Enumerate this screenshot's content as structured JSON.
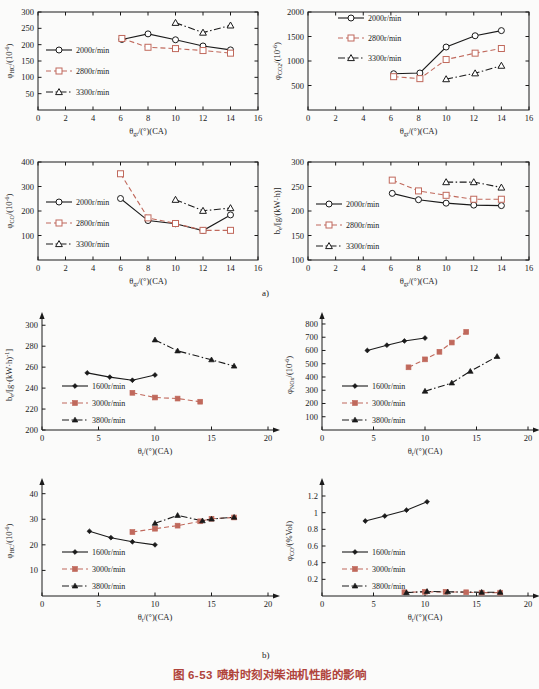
{
  "caption": {
    "part_a_label": "a)",
    "part_b_label": "b)",
    "figure_caption": "图 6-53  喷射时刻对柴油机性能的影响",
    "caption_color": "#b0443c"
  },
  "legend_labels_a": [
    "2000r/min",
    "2800r/min",
    "3300r/min"
  ],
  "legend_labels_b": [
    "1600r/min",
    "3000r/min",
    "3800r/min"
  ],
  "colors": {
    "series1": "#1a1a1a",
    "series2": "#c0695c",
    "series3": "#1a1a1a"
  },
  "chart_data": [
    {
      "id": "hc-a",
      "type": "line",
      "title": "",
      "xlabel": "θgt/(°)(CA)",
      "ylabel": "φHC/(10⁻⁶)",
      "xlim": [
        0,
        16
      ],
      "ylim": [
        0,
        300
      ],
      "xticks": [
        0,
        2,
        4,
        6,
        8,
        10,
        12,
        14,
        16
      ],
      "yticks": [
        50,
        100,
        150,
        200,
        250,
        300
      ],
      "grid": false,
      "legend_position": "left-middle",
      "series": [
        {
          "name": "2000r/min",
          "marker": "circle",
          "style": "solid",
          "color": "#1a1a1a",
          "x": [
            6.1,
            8.0,
            10.0,
            12.0,
            14.0
          ],
          "y": [
            216,
            233,
            215,
            196,
            184
          ]
        },
        {
          "name": "2800r/min",
          "marker": "square",
          "style": "dashed",
          "color": "#c0695c",
          "x": [
            6.1,
            8.0,
            10.0,
            12.0,
            14.0
          ],
          "y": [
            219,
            192,
            188,
            182,
            174
          ]
        },
        {
          "name": "3300r/min",
          "marker": "triangle",
          "style": "dashdot",
          "color": "#1a1a1a",
          "x": [
            10.0,
            12.0,
            14.0
          ],
          "y": [
            267,
            237,
            259
          ]
        }
      ]
    },
    {
      "id": "co2-a",
      "type": "line",
      "title": "",
      "xlabel": "θgt/(°)(CA)",
      "ylabel": "φCO₂/(10⁻⁶)",
      "xlim": [
        0,
        16
      ],
      "ylim": [
        0,
        2000
      ],
      "xticks": [
        0,
        2,
        4,
        6,
        8,
        10,
        12,
        14,
        16
      ],
      "yticks": [
        500,
        1000,
        1500,
        2000
      ],
      "grid": false,
      "legend_position": "top-center",
      "series": [
        {
          "name": "2000r/min",
          "marker": "circle",
          "style": "solid",
          "color": "#1a1a1a",
          "x": [
            6.2,
            8.1,
            10.0,
            12.1,
            14.0
          ],
          "y": [
            740,
            755,
            1285,
            1515,
            1620
          ]
        },
        {
          "name": "2800r/min",
          "marker": "square",
          "style": "dashed",
          "color": "#c0695c",
          "x": [
            6.2,
            8.1,
            10.0,
            12.1,
            14.0
          ],
          "y": [
            680,
            640,
            1030,
            1160,
            1255
          ]
        },
        {
          "name": "3300r/min",
          "marker": "triangle",
          "style": "dashdot",
          "color": "#1a1a1a",
          "x": [
            10.0,
            12.1,
            14.0
          ],
          "y": [
            630,
            750,
            905
          ]
        }
      ]
    },
    {
      "id": "co-a",
      "type": "line",
      "title": "",
      "xlabel": "θgt/(°)(CA)",
      "ylabel": "φCO/(10⁻⁶)",
      "xlim": [
        0,
        16
      ],
      "ylim": [
        0,
        400
      ],
      "xticks": [
        0,
        2,
        4,
        6,
        8,
        10,
        12,
        14,
        16
      ],
      "yticks": [
        100,
        200,
        300,
        400
      ],
      "grid": false,
      "legend_position": "left-middle",
      "series": [
        {
          "name": "2000r/min",
          "marker": "circle",
          "style": "solid",
          "color": "#1a1a1a",
          "x": [
            6.0,
            8.0,
            10.0,
            12.0,
            14.0
          ],
          "y": [
            251,
            161,
            148,
            120,
            184
          ]
        },
        {
          "name": "2800r/min",
          "marker": "square",
          "style": "dashed",
          "color": "#c0695c",
          "x": [
            6.0,
            8.0,
            10.0,
            12.0,
            14.0
          ],
          "y": [
            352,
            172,
            149,
            121,
            121
          ]
        },
        {
          "name": "3300r/min",
          "marker": "triangle",
          "style": "dashdot",
          "color": "#1a1a1a",
          "x": [
            10.0,
            12.0,
            14.0
          ],
          "y": [
            246,
            201,
            212
          ]
        }
      ]
    },
    {
      "id": "be-a",
      "type": "line",
      "title": "",
      "xlabel": "θgt/(°)(CA)",
      "ylabel": "be/[g/(kW·h)]",
      "xlim": [
        0,
        16
      ],
      "ylim": [
        100,
        300
      ],
      "xticks": [
        0,
        2,
        4,
        6,
        8,
        10,
        12,
        14,
        16
      ],
      "yticks": [
        100,
        150,
        200,
        250,
        300
      ],
      "grid": false,
      "legend_position": "left-middle",
      "series": [
        {
          "name": "2000r/min",
          "marker": "circle",
          "style": "solid",
          "color": "#1a1a1a",
          "x": [
            6.1,
            8.0,
            10.0,
            12.0,
            14.0
          ],
          "y": [
            236,
            223,
            216,
            212,
            211
          ]
        },
        {
          "name": "2800r/min",
          "marker": "square",
          "style": "dashed",
          "color": "#c0695c",
          "x": [
            6.1,
            8.0,
            10.0,
            12.0,
            14.0
          ],
          "y": [
            263,
            241,
            232,
            224,
            224
          ]
        },
        {
          "name": "3300r/min",
          "marker": "triangle",
          "style": "dashdot",
          "color": "#1a1a1a",
          "x": [
            10.0,
            12.0,
            14.0
          ],
          "y": [
            259,
            259,
            248
          ]
        }
      ]
    },
    {
      "id": "be-b",
      "type": "line",
      "title": "",
      "xlabel": "θt/(°)(CA)",
      "ylabel": "be/[g·(kW·h)⁻¹]",
      "xlim": [
        0,
        20
      ],
      "ylim": [
        200,
        305
      ],
      "xticks": [
        0,
        5,
        10,
        15,
        20
      ],
      "yticks": [
        200,
        220,
        240,
        260,
        280,
        300
      ],
      "grid": false,
      "legend_position": "left-middle",
      "series": [
        {
          "name": "1600r/min",
          "marker": "diamond",
          "style": "solid",
          "color": "#1a1a1a",
          "x": [
            4.0,
            6.0,
            8.0,
            10.0
          ],
          "y": [
            254.5,
            250.5,
            247.5,
            252.5
          ]
        },
        {
          "name": "3000r/min",
          "marker": "square",
          "style": "dashed",
          "color": "#c0695c",
          "x": [
            8.0,
            10.0,
            12.0,
            14.0
          ],
          "y": [
            235.5,
            231,
            230,
            227
          ]
        },
        {
          "name": "3800r/min",
          "marker": "triangle",
          "style": "dashdot",
          "color": "#1a1a1a",
          "x": [
            10.0,
            12.0,
            15.0,
            17.0
          ],
          "y": [
            286,
            275.5,
            267,
            261
          ]
        }
      ]
    },
    {
      "id": "nox-b",
      "type": "line",
      "title": "",
      "xlabel": "θt/(°)(CA)",
      "ylabel": "φNOx/(10⁻⁶)",
      "xlim": [
        0,
        20
      ],
      "ylim": [
        0,
        830
      ],
      "xticks": [
        0,
        5,
        10,
        15,
        20
      ],
      "yticks": [
        100,
        200,
        300,
        400,
        500,
        600,
        700,
        800
      ],
      "grid": false,
      "legend_position": "left-middle",
      "series": [
        {
          "name": "1600r/min",
          "marker": "diamond",
          "style": "solid",
          "color": "#1a1a1a",
          "x": [
            4.4,
            6.3,
            8.0,
            10.0
          ],
          "y": [
            600,
            640,
            672,
            694
          ]
        },
        {
          "name": "3000r/min",
          "marker": "square",
          "style": "dashed",
          "color": "#c0695c",
          "x": [
            8.4,
            10.0,
            11.4,
            12.6,
            14.0
          ],
          "y": [
            473,
            533,
            590,
            660,
            740
          ]
        },
        {
          "name": "3800r/min",
          "marker": "triangle",
          "style": "dashdot",
          "color": "#1a1a1a",
          "x": [
            10.0,
            12.6,
            14.4,
            17.0
          ],
          "y": [
            293,
            355,
            443,
            555
          ]
        }
      ]
    },
    {
      "id": "hc-b",
      "type": "line",
      "title": "",
      "xlabel": "θt/(°)(CA)",
      "ylabel": "φHC/(10⁻⁶)",
      "xlim": [
        0,
        20
      ],
      "ylim": [
        0,
        43
      ],
      "xticks": [
        0,
        5,
        10,
        15,
        20
      ],
      "yticks": [
        10,
        20,
        30,
        40
      ],
      "grid": false,
      "legend_position": "left-middle",
      "series": [
        {
          "name": "1600r/min",
          "marker": "diamond",
          "style": "solid",
          "color": "#1a1a1a",
          "x": [
            4.2,
            6.1,
            8.0,
            10.0
          ],
          "y": [
            25.3,
            22.8,
            21.2,
            20.0
          ]
        },
        {
          "name": "3000r/min",
          "marker": "square",
          "style": "dashed",
          "color": "#c0695c",
          "x": [
            8.0,
            10.0,
            12.0,
            14.0,
            15.0,
            17.0
          ],
          "y": [
            25.0,
            26.3,
            27.5,
            29.2,
            30.2,
            30.7
          ]
        },
        {
          "name": "3800r/min",
          "marker": "triangle",
          "style": "dashdot",
          "color": "#1a1a1a",
          "x": [
            10.0,
            12.0,
            14.2,
            15.0,
            17.0
          ],
          "y": [
            28.4,
            31.5,
            29.4,
            30.1,
            30.8
          ]
        }
      ]
    },
    {
      "id": "co-b",
      "type": "line",
      "title": "",
      "xlabel": "θt/(°)(CA)",
      "ylabel": "φCO/(%Vol)",
      "xlim": [
        0,
        20
      ],
      "ylim": [
        0,
        1.32
      ],
      "xticks": [
        0,
        5,
        10,
        15,
        20
      ],
      "yticks": [
        0.2,
        0.4,
        0.6,
        0.8,
        1.0,
        1.2
      ],
      "grid": false,
      "legend_position": "left-middle",
      "series": [
        {
          "name": "1600r/min",
          "marker": "diamond",
          "style": "solid",
          "color": "#1a1a1a",
          "x": [
            4.2,
            6.1,
            8.2,
            10.2
          ],
          "y": [
            0.9,
            0.96,
            1.03,
            1.13
          ]
        },
        {
          "name": "3000r/min",
          "marker": "square",
          "style": "dashed",
          "color": "#c0695c",
          "x": [
            8.0,
            10.0,
            12.0,
            14.0,
            15.5,
            17.3
          ],
          "y": [
            0.045,
            0.05,
            0.05,
            0.045,
            0.04,
            0.04
          ]
        },
        {
          "name": "3800r/min",
          "marker": "triangle",
          "style": "dashdot",
          "color": "#1a1a1a",
          "x": [
            8.2,
            10.2,
            12.2,
            15.5,
            17.3
          ],
          "y": [
            0.04,
            0.055,
            0.05,
            0.045,
            0.045
          ]
        }
      ]
    }
  ]
}
